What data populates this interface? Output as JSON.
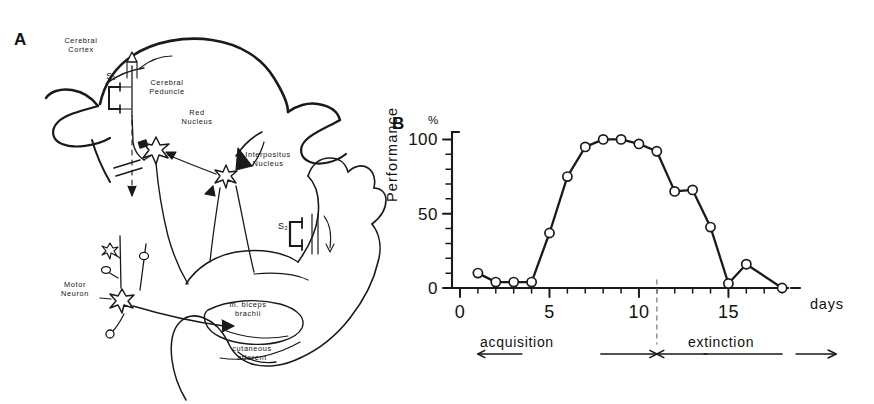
{
  "figure": {
    "panels": [
      {
        "letter": "A",
        "name": "neural-circuit-diagram"
      },
      {
        "letter": "B",
        "name": "performance-chart"
      }
    ]
  },
  "panel_a": {
    "letter": "A",
    "labels": [
      {
        "id": "cerebral-cortex",
        "text": "Cerebral\nCortex"
      },
      {
        "id": "stimulus-s1",
        "text": "S₁"
      },
      {
        "id": "cerebral-peduncle",
        "text": "Cerebral\nPeduncle"
      },
      {
        "id": "red-nucleus",
        "text": "Red\nNucleus"
      },
      {
        "id": "interpositus-nucleus",
        "text": "Interpositus\nNucleus"
      },
      {
        "id": "motor-neuron",
        "text": "Motor\nNeuron"
      },
      {
        "id": "stimulus-s2",
        "text": "S₂"
      },
      {
        "id": "biceps-brachii",
        "text": "m. biceps\nbrachii"
      },
      {
        "id": "cutaneous-afferent",
        "text": "cutaneous\nafferent"
      }
    ]
  },
  "panel_b": {
    "letter": "B",
    "unit_label": "%",
    "x_axis_title": "days",
    "y_axis_title": "Performance",
    "phases": [
      {
        "id": "acquisition",
        "label": "acquisition",
        "arrow_left": "←",
        "arrow_right": "→"
      },
      {
        "id": "extinction",
        "label": "extinction",
        "arrow_left": "←",
        "arrow_right": "→"
      }
    ],
    "divider_day": 11
  },
  "chart_data": {
    "type": "line",
    "title": "",
    "subtitle": "",
    "xlabel": "days",
    "ylabel": "Performance",
    "unit": "%",
    "xlim": [
      0,
      19
    ],
    "ylim": [
      0,
      105
    ],
    "xticks": [
      0,
      5,
      10,
      15
    ],
    "xtick_labels": [
      "0",
      "5",
      "10",
      "15"
    ],
    "yticks": [
      0,
      50,
      100
    ],
    "ytick_labels": [
      "0",
      "50",
      "100"
    ],
    "y_minor_tick_step": 10,
    "x_minor_tick_step": 1,
    "grid": false,
    "legend": null,
    "marker": "open-circle",
    "series": [
      {
        "name": "Conditioned response performance",
        "x": [
          1,
          2,
          3,
          4,
          5,
          6,
          7,
          8,
          9,
          10,
          11,
          12,
          13,
          14,
          15,
          16,
          18
        ],
        "values": [
          10,
          4,
          4,
          4,
          37,
          75,
          95,
          100,
          100,
          97,
          92,
          65,
          66,
          41,
          3,
          16,
          0
        ]
      }
    ],
    "annotations": [
      {
        "id": "phase-divider",
        "type": "vline",
        "x": 11,
        "style": "dashed"
      },
      {
        "id": "acquisition-span",
        "type": "hspan",
        "x0": 1,
        "x1": 11,
        "label": "acquisition"
      },
      {
        "id": "extinction-span",
        "type": "hspan",
        "x0": 11,
        "x1": 18,
        "label": "extinction"
      }
    ]
  }
}
